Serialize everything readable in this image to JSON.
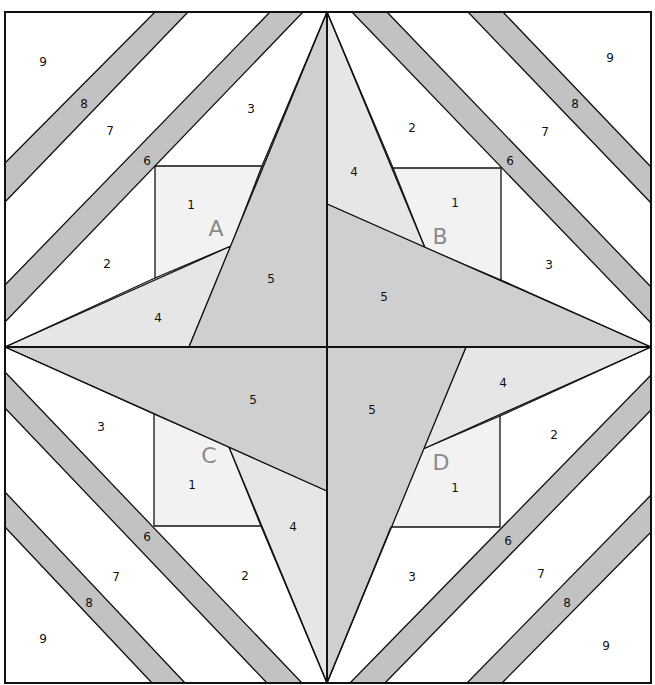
{
  "diagram": {
    "type": "paper-pieced quilt block",
    "colors": {
      "background": "#ffffff",
      "strip": "#c2c2c2",
      "piece1": "#f2f2f2",
      "piece4": "#e6e6e6",
      "piece5": "#cfcfcf",
      "line": "#111111",
      "section_letter": "#8a8a8a"
    },
    "sections": [
      {
        "letter": "A",
        "letter_pos": [
          216,
          230
        ],
        "labels": [
          {
            "text": "9",
            "pos": [
              43,
              62
            ]
          },
          {
            "text": "8",
            "pos": [
              84,
              104
            ]
          },
          {
            "text": "7",
            "pos": [
              110,
              131
            ]
          },
          {
            "text": "6",
            "pos": [
              147,
              161
            ]
          },
          {
            "text": "3",
            "pos": [
              251,
              109
            ]
          },
          {
            "text": "1",
            "pos": [
              191,
              205
            ]
          },
          {
            "text": "2",
            "pos": [
              107,
              264
            ]
          },
          {
            "text": "4",
            "pos": [
              158,
              318
            ]
          },
          {
            "text": "5",
            "pos": [
              271,
              279
            ]
          }
        ]
      },
      {
        "letter": "B",
        "letter_pos": [
          440,
          238
        ],
        "labels": [
          {
            "text": "9",
            "pos": [
              610,
              58
            ]
          },
          {
            "text": "8",
            "pos": [
              575,
              104
            ]
          },
          {
            "text": "7",
            "pos": [
              545,
              132
            ]
          },
          {
            "text": "6",
            "pos": [
              510,
              161
            ]
          },
          {
            "text": "2",
            "pos": [
              412,
              128
            ]
          },
          {
            "text": "4",
            "pos": [
              354,
              172
            ]
          },
          {
            "text": "1",
            "pos": [
              455,
              203
            ]
          },
          {
            "text": "3",
            "pos": [
              549,
              265
            ]
          },
          {
            "text": "5",
            "pos": [
              384,
              297
            ]
          }
        ]
      },
      {
        "letter": "C",
        "letter_pos": [
          209,
          457
        ],
        "labels": [
          {
            "text": "5",
            "pos": [
              253,
              400
            ]
          },
          {
            "text": "3",
            "pos": [
              101,
              427
            ]
          },
          {
            "text": "1",
            "pos": [
              192,
              485
            ]
          },
          {
            "text": "4",
            "pos": [
              293,
              527
            ]
          },
          {
            "text": "6",
            "pos": [
              147,
              537
            ]
          },
          {
            "text": "7",
            "pos": [
              116,
              577
            ]
          },
          {
            "text": "2",
            "pos": [
              245,
              576
            ]
          },
          {
            "text": "8",
            "pos": [
              89,
              603
            ]
          },
          {
            "text": "9",
            "pos": [
              43,
              639
            ]
          }
        ]
      },
      {
        "letter": "D",
        "letter_pos": [
          441,
          464
        ],
        "labels": [
          {
            "text": "5",
            "pos": [
              372,
              410
            ]
          },
          {
            "text": "4",
            "pos": [
              503,
              383
            ]
          },
          {
            "text": "2",
            "pos": [
              554,
              435
            ]
          },
          {
            "text": "1",
            "pos": [
              455,
              488
            ]
          },
          {
            "text": "6",
            "pos": [
              508,
              541
            ]
          },
          {
            "text": "3",
            "pos": [
              412,
              577
            ]
          },
          {
            "text": "7",
            "pos": [
              541,
              574
            ]
          },
          {
            "text": "8",
            "pos": [
              567,
              603
            ]
          },
          {
            "text": "9",
            "pos": [
              606,
              646
            ]
          }
        ]
      }
    ]
  }
}
